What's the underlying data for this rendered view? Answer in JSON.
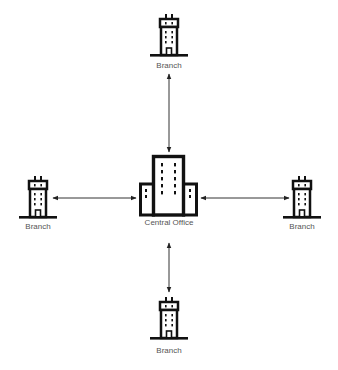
{
  "diagram": {
    "type": "hub-and-spoke network",
    "colors": {
      "stroke": "#111111",
      "label": "#555555",
      "connector": "#333333",
      "background": "#ffffff"
    },
    "center": {
      "id": "central",
      "label": "Central Office",
      "icon": "office-complex-icon"
    },
    "nodes": [
      {
        "id": "branch-top",
        "label": "Branch",
        "icon": "office-building-icon"
      },
      {
        "id": "branch-left",
        "label": "Branch",
        "icon": "office-building-icon"
      },
      {
        "id": "branch-right",
        "label": "Branch",
        "icon": "office-building-icon"
      },
      {
        "id": "branch-bottom",
        "label": "Branch",
        "icon": "office-building-icon"
      }
    ],
    "edges": [
      {
        "from": "central",
        "to": "branch-top",
        "direction": "bidirectional"
      },
      {
        "from": "central",
        "to": "branch-left",
        "direction": "bidirectional"
      },
      {
        "from": "central",
        "to": "branch-right",
        "direction": "bidirectional"
      },
      {
        "from": "central",
        "to": "branch-bottom",
        "direction": "bidirectional"
      }
    ]
  }
}
